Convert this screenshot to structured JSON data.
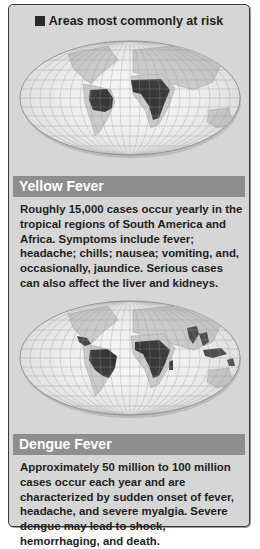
{
  "legend": {
    "label": "Areas most commonly at risk",
    "swatch_color": "#2a2a2a",
    "icon": "black-square-swatch"
  },
  "sections": [
    {
      "title": "Yellow Fever",
      "map": "world-map-yellow-fever-risk",
      "highlighted_regions": [
        "Northern South America",
        "Sub-Saharan Africa"
      ],
      "body": "Roughly 15,000 cases occur yearly in the tropical regions of South America and Africa. Symptoms include fever; headache; chills; nausea; vomiting, and, occasionally, jaundice. Serious cases can also affect the liver and kidneys."
    },
    {
      "title": "Dengue Fever",
      "map": "world-map-dengue-fever-risk",
      "highlighted_regions": [
        "Central America",
        "Northern South America",
        "Sub-Saharan Africa",
        "India",
        "Southeast Asia",
        "Indonesia",
        "Northern Australia"
      ],
      "body": "Approximately 50 million to 100 million cases occur each year and are characterized by sudden onset of fever, headache, and severe myalgia. Severe dengue may lead to shock, hemorrhaging, and death."
    }
  ],
  "colors": {
    "panel_bg": "#d6d6d6",
    "header_bg": "#8e8e8e",
    "risk_fill": "#2a2a2a",
    "land": "#c4c4c4",
    "ocean": "#f2f2f2"
  }
}
